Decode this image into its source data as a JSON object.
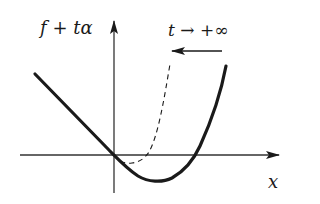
{
  "figure": {
    "y_axis_label": {
      "f": "f",
      "plus": " + ",
      "t": "t",
      "alpha": "α"
    },
    "x_axis_label": "x",
    "limit_annotation": {
      "t": "t",
      "arrow": " → ",
      "limit": "+∞"
    },
    "colors": {
      "ink": "#1a1a1a",
      "axis": "#333333",
      "background": "#ffffff"
    },
    "curves": [
      {
        "name": "f + tα (current)",
        "style": "solid",
        "description": "linear descent on left, passes through origin, minimum below x-axis, rises steeply on right"
      },
      {
        "name": "f + tα (limit)",
        "style": "dashed",
        "description": "shifted version with minimum near origin, rises steeply closer to y-axis"
      }
    ],
    "motion_arrow": {
      "direction": "left",
      "meaning": "curve shifts left as t increases"
    }
  }
}
